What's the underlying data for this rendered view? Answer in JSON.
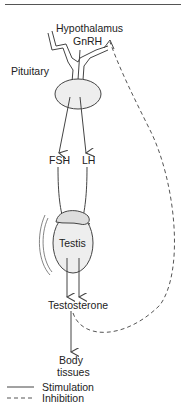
{
  "labels": {
    "hypothalamus": "Hypothalamus",
    "gnrh": "GnRH",
    "pituitary": "Pituitary",
    "fsh": "FSH",
    "lh": "LH",
    "testis": "Testis",
    "testosterone": "Testosterone",
    "body": "Body",
    "tissues": "tissues"
  },
  "legend": {
    "stimulation": "Stimulation",
    "inhibition": "Inhibition"
  },
  "colors": {
    "line": "#444444",
    "dashed": "#555555",
    "gland_fill": "#eeeeee"
  }
}
